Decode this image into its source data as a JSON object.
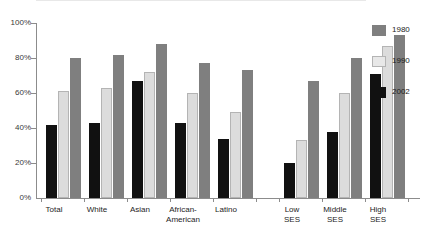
{
  "chart_data": {
    "type": "bar",
    "title": "",
    "xlabel": "",
    "ylabel": "",
    "ylim": [
      0,
      100
    ],
    "grid": false,
    "legend_position": "right",
    "categories": [
      "Total",
      "White",
      "Asian",
      "African-American",
      "Latino",
      "Low SES",
      "Middle SES",
      "High SES"
    ],
    "series": [
      {
        "name": "2002",
        "color": "#111111",
        "values": [
          42,
          43,
          67,
          43,
          34,
          20,
          38,
          71
        ]
      },
      {
        "name": "1990",
        "color": "#dcdcdc",
        "values": [
          61,
          63,
          72,
          60,
          49,
          33,
          60,
          87
        ]
      },
      {
        "name": "1980",
        "color": "#7f7f7f",
        "values": [
          80,
          82,
          88,
          77,
          73,
          67,
          80,
          93
        ]
      }
    ],
    "ytick_labels": [
      "100%",
      "80%",
      "60%",
      "40%",
      "20%",
      "0%"
    ],
    "ytick_values": [
      100,
      80,
      60,
      40,
      20,
      0
    ]
  },
  "axis": {
    "ticks": [
      {
        "label": "100%",
        "value": 100
      },
      {
        "label": "80%",
        "value": 80
      },
      {
        "label": "60%",
        "value": 60
      },
      {
        "label": "40%",
        "value": 40
      },
      {
        "label": "20%",
        "value": 20
      },
      {
        "label": "0%",
        "value": 0
      }
    ]
  },
  "categories": [
    {
      "line1": "Total",
      "line2": ""
    },
    {
      "line1": "White",
      "line2": ""
    },
    {
      "line1": "Asian",
      "line2": ""
    },
    {
      "line1": "African-",
      "line2": "American"
    },
    {
      "line1": "Latino",
      "line2": ""
    },
    {
      "line1": "Low",
      "line2": "SES"
    },
    {
      "line1": "Middle",
      "line2": "SES"
    },
    {
      "line1": "High",
      "line2": "SES"
    }
  ],
  "legend": {
    "items": [
      {
        "label": "1980",
        "color": "#7f7f7f"
      },
      {
        "label": "1990",
        "color": "#dcdcdc"
      },
      {
        "label": "2002",
        "color": "#111111"
      }
    ]
  }
}
